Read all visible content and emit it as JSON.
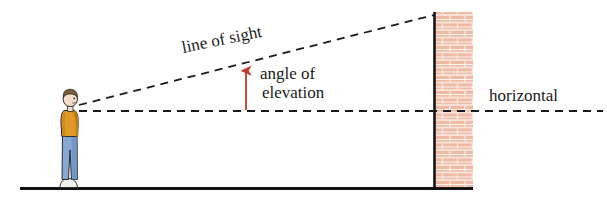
{
  "diagram": {
    "labels": {
      "line_of_sight": "line of sight",
      "angle_of_elevation_line1": "angle of",
      "angle_of_elevation_line2": "elevation",
      "horizontal": "horizontal"
    },
    "colors": {
      "line": "#1a1a1a",
      "arrow": "#c0392b",
      "ground": "#141414",
      "wall_edge": "#141414",
      "brick_fill": "#f6dfd6",
      "brick_face": "#e8a78e",
      "brick_mortar": "#ffffff",
      "shirt": "#e09a28",
      "shirt_shadow": "#c07d18",
      "jeans": "#7ba3d0",
      "jeans_shadow": "#5d86b5",
      "skin": "#f2ddc8",
      "hair": "#7a5c3e",
      "shoe": "#f2f0ea",
      "outline": "#2b2b2b"
    },
    "elements": {
      "person": "person-figure",
      "wall": "brick-wall",
      "ground": "ground-line",
      "line_of_sight": "line-of-sight-dashed",
      "horizontal_line": "horizontal-dashed",
      "angle_arrow": "angle-arrow"
    }
  }
}
